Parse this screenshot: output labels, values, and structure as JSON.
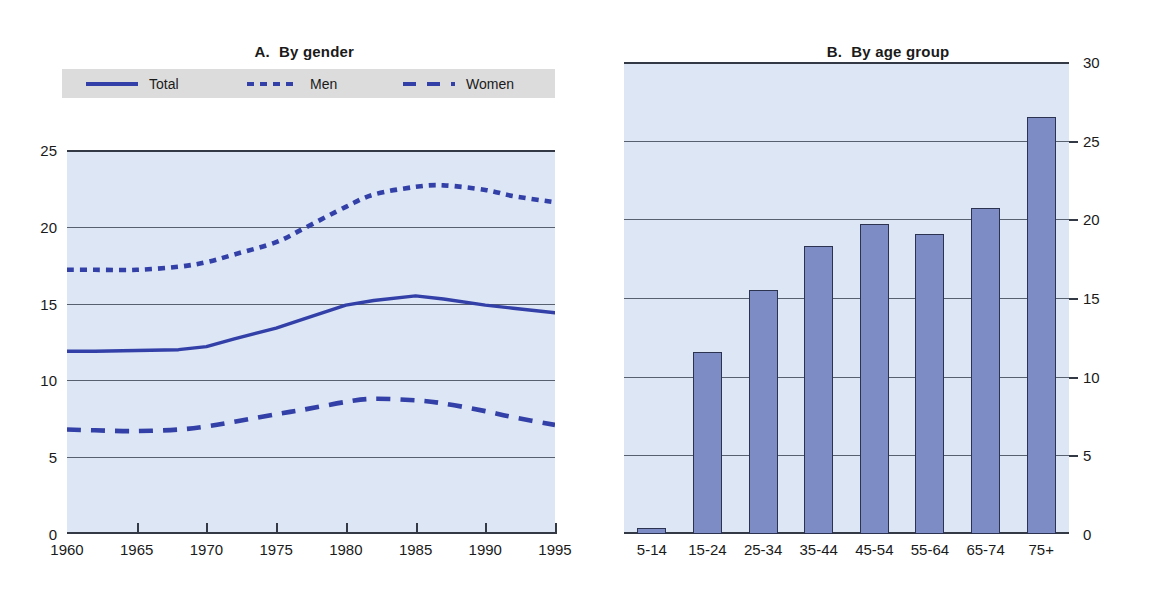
{
  "panel_a": {
    "title_label": "A.",
    "title_text": "By gender",
    "legend": [
      {
        "name": "Total",
        "style": "solid"
      },
      {
        "name": "Men",
        "style": "dotted"
      },
      {
        "name": "Women",
        "style": "dashed"
      }
    ],
    "y_ticks": [
      "0",
      "5",
      "10",
      "15",
      "20",
      "25"
    ],
    "x_ticks": [
      "1960",
      "1965",
      "1970",
      "1975",
      "1980",
      "1985",
      "1990",
      "1995"
    ]
  },
  "panel_b": {
    "title_label": "B.",
    "title_text": "By age group",
    "y_ticks": [
      "0",
      "5",
      "10",
      "15",
      "20",
      "25",
      "30"
    ],
    "x_ticks": [
      "5-14",
      "15-24",
      "25-34",
      "35-44",
      "45-54",
      "55-64",
      "65-74",
      "75+"
    ]
  },
  "colors": {
    "series_blue": "#3340a8",
    "bar_fill": "#7e8cc6",
    "bar_stroke": "#2c3350",
    "plot_background": "#dce6f4",
    "legend_background": "#dcdcdc",
    "axis": "#343a45",
    "gridline": "#56606e",
    "text": "#1a1a1a"
  },
  "chart_data": [
    {
      "type": "line",
      "title": "A.   By gender",
      "xlabel": "",
      "ylabel": "",
      "xlim": [
        1960,
        1995
      ],
      "ylim": [
        0,
        25
      ],
      "ytick_step": 5,
      "xtick_step": 5,
      "grid": true,
      "legend_position": "above-plot",
      "x": [
        1960,
        1962,
        1965,
        1968,
        1970,
        1972,
        1975,
        1977,
        1980,
        1982,
        1985,
        1987,
        1990,
        1992,
        1995
      ],
      "series": [
        {
          "name": "Total",
          "style": "solid",
          "values": [
            11.9,
            11.9,
            11.95,
            12.0,
            12.2,
            12.7,
            13.4,
            14.0,
            14.9,
            15.2,
            15.5,
            15.3,
            14.9,
            14.7,
            14.4
          ]
        },
        {
          "name": "Men",
          "style": "dotted",
          "values": [
            17.2,
            17.2,
            17.2,
            17.4,
            17.7,
            18.2,
            19.0,
            19.9,
            21.3,
            22.1,
            22.6,
            22.7,
            22.4,
            22.0,
            21.6
          ]
        },
        {
          "name": "Women",
          "style": "dashed",
          "values": [
            6.8,
            6.75,
            6.7,
            6.8,
            7.0,
            7.3,
            7.8,
            8.1,
            8.6,
            8.8,
            8.7,
            8.5,
            8.0,
            7.6,
            7.1
          ]
        }
      ]
    },
    {
      "type": "bar",
      "title": "B.   By age group",
      "xlabel": "",
      "ylabel": "",
      "ylim": [
        0,
        30
      ],
      "ytick_step": 5,
      "grid": true,
      "yaxis_side": "right",
      "categories": [
        "5-14",
        "15-24",
        "25-34",
        "35-44",
        "45-54",
        "55-64",
        "65-74",
        "75+"
      ],
      "values": [
        0.4,
        11.6,
        15.5,
        18.3,
        19.7,
        19.1,
        20.7,
        26.5
      ]
    }
  ]
}
